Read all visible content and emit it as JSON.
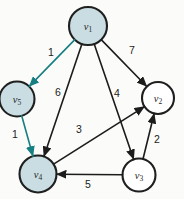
{
  "figure": {
    "kind": "directed-weighted-graph",
    "background": "#fbfcf9"
  },
  "graph": {
    "nodes": [
      {
        "id": "v1",
        "symbol": "v",
        "subscript": "1",
        "shaded": true
      },
      {
        "id": "v2",
        "symbol": "v",
        "subscript": "2",
        "shaded": false
      },
      {
        "id": "v3",
        "symbol": "v",
        "subscript": "3",
        "shaded": false
      },
      {
        "id": "v4",
        "symbol": "v",
        "subscript": "4",
        "shaded": true
      },
      {
        "id": "v5",
        "symbol": "v",
        "subscript": "5",
        "shaded": true
      }
    ],
    "edges": [
      {
        "from": "v1",
        "to": "v5",
        "weight": "1",
        "color": "teal"
      },
      {
        "from": "v5",
        "to": "v4",
        "weight": "1",
        "color": "teal"
      },
      {
        "from": "v1",
        "to": "v4",
        "weight": "6",
        "color": "black"
      },
      {
        "from": "v1",
        "to": "v3",
        "weight": "4",
        "color": "black"
      },
      {
        "from": "v1",
        "to": "v2",
        "weight": "7",
        "color": "black"
      },
      {
        "from": "v4",
        "to": "v2",
        "weight": "3",
        "color": "black"
      },
      {
        "from": "v3",
        "to": "v2",
        "weight": "2",
        "color": "black"
      },
      {
        "from": "v3",
        "to": "v4",
        "weight": "5",
        "color": "black"
      }
    ],
    "colors": {
      "shaded_node_fill": "#c9dde2",
      "plain_node_fill": "#ffffff",
      "node_stroke": "#1f1f1f",
      "black_edge": "#1c1c1c",
      "teal_edge": "#177e81"
    }
  }
}
